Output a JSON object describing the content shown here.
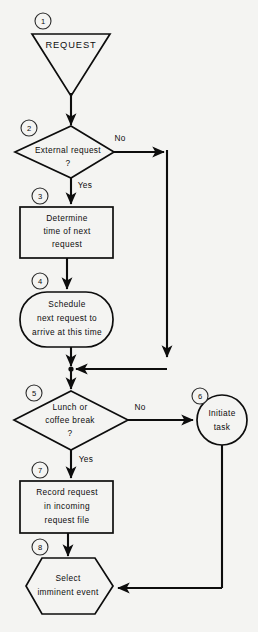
{
  "diagram": {
    "background_color": "#f4f4f2",
    "line_color": "#0d0d0d",
    "nodes": [
      {
        "step": "1",
        "shape": "inverted-triangle",
        "name": "request-input",
        "lines": [
          "REQUEST"
        ]
      },
      {
        "step": "2",
        "shape": "diamond",
        "name": "external-request-decision",
        "lines": [
          "External request",
          "?"
        ]
      },
      {
        "step": "3",
        "shape": "rectangle",
        "name": "determine-time-process",
        "lines": [
          "Determine",
          "time of next",
          "request"
        ]
      },
      {
        "step": "4",
        "shape": "stadium",
        "name": "schedule-next-request",
        "lines": [
          "Schedule",
          "next request to",
          "arrive at this time"
        ]
      },
      {
        "step": "5",
        "shape": "diamond",
        "name": "lunch-or-break-decision",
        "lines": [
          "Lunch or",
          "coffee break",
          "?"
        ]
      },
      {
        "step": "6",
        "shape": "circle",
        "name": "initiate-task",
        "lines": [
          "Initiate",
          "task"
        ]
      },
      {
        "step": "7",
        "shape": "rectangle",
        "name": "record-request-process",
        "lines": [
          "Record request",
          "in incoming",
          "request file"
        ]
      },
      {
        "step": "8",
        "shape": "hexagon",
        "name": "select-imminent-event",
        "lines": [
          "Select",
          "imminent event"
        ]
      }
    ],
    "branch_labels": [
      {
        "name": "decision-2-no",
        "text": "No"
      },
      {
        "name": "decision-2-yes",
        "text": "Yes"
      },
      {
        "name": "decision-5-no",
        "text": "No"
      },
      {
        "name": "decision-5-yes",
        "text": "Yes"
      }
    ]
  }
}
